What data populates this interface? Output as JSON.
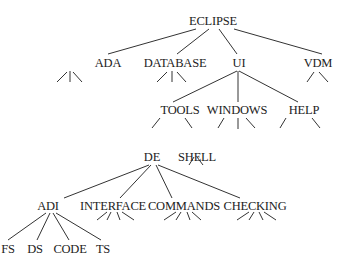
{
  "diagram": {
    "type": "tree",
    "colors": {
      "text": "#222222",
      "line": "#333333",
      "background": "#ffffff"
    },
    "nodes": [
      {
        "id": "eclipse",
        "label": "ECLIPSE",
        "x": 213,
        "y": 15
      },
      {
        "id": "ada",
        "label": "ADA",
        "x": 108,
        "y": 57
      },
      {
        "id": "database",
        "label": "DATABASE",
        "x": 175,
        "y": 57
      },
      {
        "id": "ui",
        "label": "UI",
        "x": 239,
        "y": 57
      },
      {
        "id": "vdm",
        "label": "VDM",
        "x": 318,
        "y": 57
      },
      {
        "id": "tools",
        "label": "TOOLS",
        "x": 180,
        "y": 104
      },
      {
        "id": "windows",
        "label": "WINDOWS",
        "x": 237,
        "y": 104
      },
      {
        "id": "help",
        "label": "HELP",
        "x": 304,
        "y": 104
      },
      {
        "id": "de",
        "label": "DE",
        "x": 152,
        "y": 151
      },
      {
        "id": "shell",
        "label": "SHELL",
        "x": 197,
        "y": 151
      },
      {
        "id": "adi",
        "label": "ADI",
        "x": 48,
        "y": 200
      },
      {
        "id": "interface",
        "label": "INTERFACE",
        "x": 113,
        "y": 200
      },
      {
        "id": "commands",
        "label": "COMMANDS",
        "x": 184,
        "y": 200
      },
      {
        "id": "checking",
        "label": "CHECKING",
        "x": 255,
        "y": 200
      },
      {
        "id": "fs",
        "label": "FS",
        "x": 8,
        "y": 243
      },
      {
        "id": "ds",
        "label": "DS",
        "x": 35,
        "y": 243
      },
      {
        "id": "code",
        "label": "CODE",
        "x": 70,
        "y": 243
      },
      {
        "id": "ts",
        "label": "TS",
        "x": 103,
        "y": 243
      }
    ],
    "edges": [
      [
        196,
        29,
        108,
        54
      ],
      [
        209,
        29,
        177,
        54
      ],
      [
        219,
        29,
        237,
        54
      ],
      [
        234,
        29,
        322,
        54
      ],
      [
        237,
        71,
        173,
        102
      ],
      [
        238,
        71,
        238,
        102
      ],
      [
        239,
        71,
        298,
        102
      ],
      [
        160,
        118,
        152,
        128
      ],
      [
        185,
        118,
        192,
        128
      ],
      [
        224,
        118,
        218,
        128
      ],
      [
        238,
        118,
        238,
        129
      ],
      [
        246,
        118,
        255,
        128
      ],
      [
        286,
        118,
        280,
        128
      ],
      [
        312,
        118,
        320,
        128
      ],
      [
        149,
        165,
        64,
        198
      ],
      [
        151,
        165,
        120,
        198
      ],
      [
        156,
        165,
        172,
        198
      ],
      [
        158,
        165,
        240,
        198
      ],
      [
        46,
        213,
        8,
        240
      ],
      [
        50,
        213,
        37,
        240
      ],
      [
        53,
        213,
        69,
        240
      ],
      [
        56,
        213,
        101,
        240
      ],
      [
        67,
        72,
        57,
        82
      ],
      [
        70,
        71,
        70,
        82
      ],
      [
        73,
        72,
        82,
        82
      ],
      [
        167,
        72,
        157,
        82
      ],
      [
        172,
        71,
        172,
        82
      ],
      [
        177,
        72,
        186,
        82
      ],
      [
        314,
        72,
        307,
        82
      ],
      [
        319,
        72,
        328,
        82
      ],
      [
        194,
        157,
        189,
        165
      ],
      [
        197,
        157,
        203,
        165
      ],
      [
        107,
        212,
        97,
        220
      ],
      [
        111,
        212,
        107,
        220
      ],
      [
        117,
        212,
        120,
        220
      ],
      [
        122,
        212,
        134,
        220
      ],
      [
        176,
        212,
        164,
        220
      ],
      [
        181,
        212,
        176,
        220
      ],
      [
        187,
        212,
        190,
        220
      ],
      [
        192,
        212,
        201,
        220
      ],
      [
        249,
        212,
        237,
        220
      ],
      [
        254,
        212,
        249,
        220
      ],
      [
        259,
        212,
        263,
        220
      ],
      [
        264,
        212,
        276,
        220
      ]
    ]
  }
}
